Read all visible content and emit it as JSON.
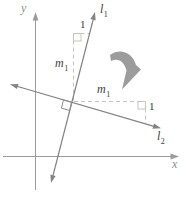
{
  "figure": {
    "colors": {
      "axis": "#9b9b9b",
      "line": "#838383",
      "dashed": "#c9c3bd",
      "marker": "#8f8f8f",
      "arrow_fill": "#9c9c9c",
      "text_dark": "#3c3c3c",
      "text_axis": "#8e8e8e"
    },
    "labels": {
      "y_axis": "y",
      "x_axis": "x",
      "line1_base": "l",
      "line1_sub": "1",
      "line2_base": "l",
      "line2_sub": "2",
      "slope_left_base": "m",
      "slope_left_sub": "1",
      "slope_right_base": "m",
      "slope_right_sub": "1",
      "run_top": "1",
      "rise_right": "1"
    }
  }
}
